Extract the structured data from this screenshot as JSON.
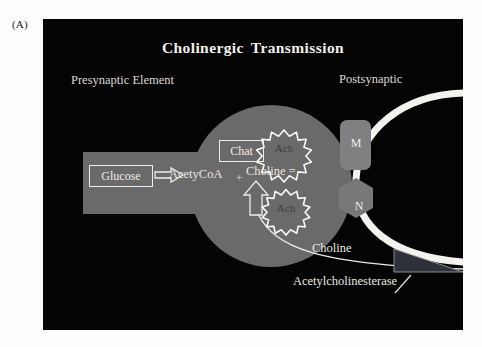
{
  "figure": {
    "panel_label": "(A)",
    "title": "Cholinergic  Transmission",
    "background_color": "#040404",
    "cell_color": "#6a6a6a",
    "membrane_color": "#f4f2ee",
    "text_color": "#e9e6e0"
  },
  "labels": {
    "presynaptic": "Presynaptic Element",
    "postsynaptic": "Postsynaptic"
  },
  "nodes": {
    "glucose": "Glucose",
    "chat": "Chat",
    "acetycoa": "AcetyCoA",
    "plus": "+",
    "choline_eq": "Choline =",
    "choline_reuptake": "Choline",
    "acetylcholinesterase": "Acetylcholinesterase"
  },
  "vesicles": [
    {
      "label": "Ach"
    },
    {
      "label": "Ach"
    }
  ],
  "receptors": [
    {
      "label": "M",
      "shape": "rounded-rect"
    },
    {
      "label": "N",
      "shape": "hexagon"
    }
  ],
  "icons": {
    "glucose_arrow": "arrow-right-outline-icon",
    "release_arrow": "arrow-up-outline-icon",
    "enzyme": "enzyme-wedge-icon",
    "leader_line": "leader-line-icon"
  }
}
